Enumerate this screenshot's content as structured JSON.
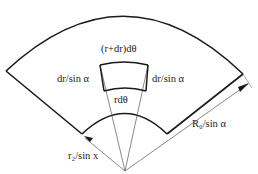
{
  "diagram": {
    "type": "annular-sector",
    "colors": {
      "stroke": "#1a1a1a",
      "thin_stroke": "#555555",
      "background": "#ffffff"
    },
    "labels": {
      "top_element": "(r+dr)dθ",
      "left_side": "dr/sin α",
      "right_side": "dr/sin α",
      "bottom_element": "rdθ",
      "outer_radius": "R₀/sin α",
      "inner_radius": "r₂/sin x"
    }
  }
}
